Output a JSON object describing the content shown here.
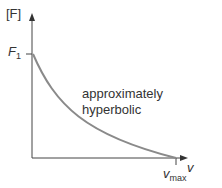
{
  "diagram": {
    "y_axis_label": "[F]",
    "x_axis_label": "v",
    "y_intercept_label": {
      "main": "F",
      "sub": "1"
    },
    "x_intercept_label": {
      "main": "v",
      "sub": "max"
    },
    "annotation_line1": "approximately",
    "annotation_line2": "hyperbolic",
    "curve_color": "#8a8a8a",
    "axis_color": "#333333"
  }
}
